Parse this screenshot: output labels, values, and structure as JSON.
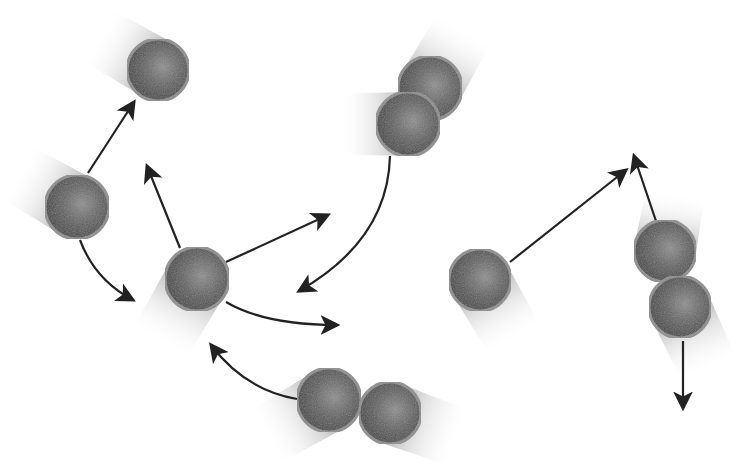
{
  "diagram": {
    "title": "",
    "width": 747,
    "height": 468,
    "colors": {
      "background": "#ffffff",
      "sphere_dark": "#4a4a4a",
      "sphere_mid": "#6e6e6e",
      "sphere_light": "#9a9a9a",
      "sphere_rim": "#8c8c8c",
      "trail": "#9e9e9e",
      "arrow": "#222222"
    },
    "particles": [
      {
        "id": "p1",
        "cx": 158,
        "cy": 70,
        "r": 31,
        "trail_angle": -150,
        "trail_len": 70
      },
      {
        "id": "p2",
        "cx": 77,
        "cy": 207,
        "r": 32,
        "trail_angle": -150,
        "trail_len": 70
      },
      {
        "id": "p3",
        "cx": 430,
        "cy": 88,
        "r": 32,
        "trail_angle": -60,
        "trail_len": 70
      },
      {
        "id": "p4",
        "cx": 408,
        "cy": 124,
        "r": 32,
        "trail_angle": 180,
        "trail_len": 70
      },
      {
        "id": "p5",
        "cx": 197,
        "cy": 279,
        "r": 32,
        "trail_angle": 120,
        "trail_len": 75
      },
      {
        "id": "p6",
        "cx": 480,
        "cy": 280,
        "r": 31,
        "trail_angle": 60,
        "trail_len": 70
      },
      {
        "id": "p7",
        "cx": 665,
        "cy": 251,
        "r": 31,
        "trail_angle": -80,
        "trail_len": 60
      },
      {
        "id": "p8",
        "cx": 680,
        "cy": 307,
        "r": 31,
        "trail_angle": 65,
        "trail_len": 70
      },
      {
        "id": "p9",
        "cx": 329,
        "cy": 400,
        "r": 32,
        "trail_angle": 150,
        "trail_len": 75
      },
      {
        "id": "p10",
        "cx": 390,
        "cy": 413,
        "r": 31,
        "trail_angle": 20,
        "trail_len": 75
      }
    ],
    "arrows": [
      {
        "id": "a1",
        "d": "M 88 173 L 134 102"
      },
      {
        "id": "a2",
        "d": "M 80 240 Q 95 280 133 300"
      },
      {
        "id": "a3",
        "d": "M 180 248 L 147 166"
      },
      {
        "id": "a4",
        "d": "M 226 262 L 328 215"
      },
      {
        "id": "a5",
        "d": "M 226 302 Q 265 325 337 325"
      },
      {
        "id": "a6",
        "d": "M 390 156 Q 388 240 299 291"
      },
      {
        "id": "a7",
        "d": "M 297 399 Q 245 390 211 345"
      },
      {
        "id": "a8",
        "d": "M 510 262 L 626 170"
      },
      {
        "id": "a9",
        "d": "M 656 221 L 634 156"
      },
      {
        "id": "a10",
        "d": "M 683 341 L 683 408"
      }
    ]
  }
}
